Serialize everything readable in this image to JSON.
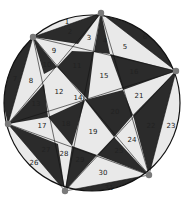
{
  "diagram": {
    "colors": {
      "dark": "#2b2b2b",
      "light": "#e9e9e9",
      "outline": "#111111",
      "vertex": "#7a7a7a"
    },
    "vertices": [
      {
        "id": "A",
        "x": 33,
        "y": 37
      },
      {
        "id": "B",
        "x": 101,
        "y": 13
      },
      {
        "id": "C",
        "x": 176,
        "y": 71
      },
      {
        "id": "D",
        "x": 149,
        "y": 175
      },
      {
        "id": "E",
        "x": 65,
        "y": 191
      },
      {
        "id": "F",
        "x": 8,
        "y": 124
      }
    ],
    "regions": [
      {
        "n": "1",
        "x": 67,
        "y": 22
      },
      {
        "n": "2",
        "x": 70,
        "y": 32
      },
      {
        "n": "3",
        "x": 89,
        "y": 38
      },
      {
        "n": "4",
        "x": 105,
        "y": 41
      },
      {
        "n": "5",
        "x": 125,
        "y": 47
      },
      {
        "n": "6",
        "x": 145,
        "y": 37
      },
      {
        "n": "7",
        "x": 15,
        "y": 79
      },
      {
        "n": "8",
        "x": 31,
        "y": 81
      },
      {
        "n": "9",
        "x": 54,
        "y": 51
      },
      {
        "n": "10",
        "x": 47,
        "y": 65
      },
      {
        "n": "11",
        "x": 77,
        "y": 66
      },
      {
        "n": "12",
        "x": 59,
        "y": 92
      },
      {
        "n": "13",
        "x": 36,
        "y": 104
      },
      {
        "n": "14",
        "x": 78,
        "y": 98
      },
      {
        "n": "15",
        "x": 104,
        "y": 76
      },
      {
        "n": "16",
        "x": 134,
        "y": 72
      },
      {
        "n": "17",
        "x": 42,
        "y": 126
      },
      {
        "n": "18",
        "x": 66,
        "y": 124
      },
      {
        "n": "19",
        "x": 93,
        "y": 132
      },
      {
        "n": "20",
        "x": 115,
        "y": 112
      },
      {
        "n": "21",
        "x": 139,
        "y": 96
      },
      {
        "n": "22",
        "x": 151,
        "y": 126
      },
      {
        "n": "23",
        "x": 171,
        "y": 126
      },
      {
        "n": "24",
        "x": 132,
        "y": 140
      },
      {
        "n": "25",
        "x": 119,
        "y": 151
      },
      {
        "n": "26",
        "x": 34,
        "y": 163
      },
      {
        "n": "27",
        "x": 46,
        "y": 150
      },
      {
        "n": "28",
        "x": 64,
        "y": 154
      },
      {
        "n": "29",
        "x": 80,
        "y": 160
      },
      {
        "n": "30",
        "x": 103,
        "y": 173
      },
      {
        "n": "31",
        "x": 109,
        "y": 188
      }
    ]
  }
}
